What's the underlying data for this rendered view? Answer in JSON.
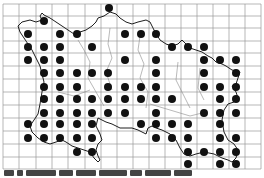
{
  "map": {
    "title": "",
    "type": "distribution dot map on grid",
    "grid": {
      "x_lines": [
        3,
        19,
        36,
        52,
        68,
        85,
        101,
        117,
        133,
        149,
        165,
        181,
        197,
        213,
        229,
        245,
        261
      ],
      "y_lines": [
        4,
        16,
        28,
        41,
        53,
        66,
        79,
        92,
        105,
        118,
        131,
        144,
        157,
        169
      ],
      "color": "#9a9a9a"
    },
    "dot_color": "#111111",
    "dot_radius": 4,
    "dots": [
      [
        109,
        8
      ],
      [
        44,
        21
      ],
      [
        28,
        34
      ],
      [
        60,
        34
      ],
      [
        77,
        34
      ],
      [
        125,
        34
      ],
      [
        141,
        34
      ],
      [
        156,
        34
      ],
      [
        28,
        47
      ],
      [
        44,
        47
      ],
      [
        60,
        47
      ],
      [
        92,
        47
      ],
      [
        172,
        47
      ],
      [
        188,
        47
      ],
      [
        204,
        47
      ],
      [
        28,
        60
      ],
      [
        44,
        60
      ],
      [
        60,
        60
      ],
      [
        125,
        60
      ],
      [
        156,
        60
      ],
      [
        204,
        60
      ],
      [
        220,
        60
      ],
      [
        236,
        60
      ],
      [
        44,
        73
      ],
      [
        60,
        73
      ],
      [
        77,
        73
      ],
      [
        92,
        73
      ],
      [
        108,
        73
      ],
      [
        156,
        73
      ],
      [
        204,
        73
      ],
      [
        236,
        73
      ],
      [
        44,
        87
      ],
      [
        60,
        87
      ],
      [
        77,
        87
      ],
      [
        108,
        87
      ],
      [
        125,
        87
      ],
      [
        141,
        87
      ],
      [
        156,
        87
      ],
      [
        204,
        87
      ],
      [
        220,
        87
      ],
      [
        236,
        87
      ],
      [
        44,
        99
      ],
      [
        60,
        99
      ],
      [
        77,
        99
      ],
      [
        92,
        99
      ],
      [
        108,
        99
      ],
      [
        125,
        99
      ],
      [
        141,
        99
      ],
      [
        156,
        99
      ],
      [
        172,
        99
      ],
      [
        220,
        99
      ],
      [
        236,
        99
      ],
      [
        44,
        113
      ],
      [
        60,
        113
      ],
      [
        77,
        113
      ],
      [
        92,
        113
      ],
      [
        108,
        113
      ],
      [
        125,
        113
      ],
      [
        156,
        113
      ],
      [
        204,
        113
      ],
      [
        220,
        113
      ],
      [
        236,
        113
      ],
      [
        28,
        124
      ],
      [
        44,
        124
      ],
      [
        60,
        124
      ],
      [
        77,
        124
      ],
      [
        92,
        124
      ],
      [
        141,
        124
      ],
      [
        156,
        124
      ],
      [
        172,
        124
      ],
      [
        188,
        124
      ],
      [
        220,
        124
      ],
      [
        28,
        138
      ],
      [
        44,
        138
      ],
      [
        60,
        138
      ],
      [
        77,
        138
      ],
      [
        92,
        138
      ],
      [
        156,
        138
      ],
      [
        172,
        138
      ],
      [
        188,
        138
      ],
      [
        220,
        138
      ],
      [
        236,
        138
      ],
      [
        77,
        152
      ],
      [
        92,
        152
      ],
      [
        188,
        152
      ],
      [
        204,
        152
      ],
      [
        220,
        152
      ],
      [
        236,
        152
      ],
      [
        188,
        164
      ],
      [
        220,
        164
      ],
      [
        236,
        164
      ]
    ],
    "coastline_color": "#222222",
    "boundary_color": "#888888",
    "caption": ""
  }
}
